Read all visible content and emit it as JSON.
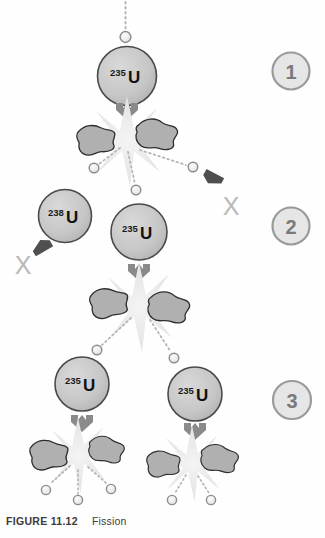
{
  "figure": {
    "caption_label": "FIGURE 11.12",
    "caption_title": "Fission",
    "palette": {
      "nucleus_fill": "#c9c9c9",
      "nucleus_stroke": "#4a4a4a",
      "fragment_fill": "#b0b0b0",
      "fragment_stroke": "#2e2e2e",
      "neutron_fill": "#efefef",
      "neutron_stroke": "#8d8d8d",
      "burst_fill": "#e8e8e8",
      "arrow_fill": "#8a8a8a",
      "arrow_dark": "#4f4f4f",
      "badge_stroke": "#9a9a9a",
      "badge_fill": "#e0e0e0",
      "x_color": "#b9b9b9",
      "trail_color": "#b5b5b5",
      "text_dark": "#111111",
      "caption_color": "#3b3b3b"
    }
  },
  "stages": [
    {
      "number": "1"
    },
    {
      "number": "2"
    },
    {
      "number": "3"
    }
  ],
  "nuclei": [
    {
      "mass": "235",
      "symbol": "U",
      "stage": "1",
      "role": "fissile-target"
    },
    {
      "mass": "238",
      "symbol": "U",
      "stage": "2",
      "role": "non-fissile-absorber"
    },
    {
      "mass": "235",
      "symbol": "U",
      "stage": "2",
      "role": "fissile-target"
    },
    {
      "mass": "235",
      "symbol": "U",
      "stage": "3",
      "role": "fissile-target"
    },
    {
      "mass": "235",
      "symbol": "U",
      "stage": "3",
      "role": "fissile-target"
    }
  ],
  "marks": [
    {
      "label": "X",
      "meaning": "neutron-lost-no-fission",
      "side": "left"
    },
    {
      "label": "X",
      "meaning": "neutron-lost-no-fission",
      "side": "right"
    }
  ]
}
